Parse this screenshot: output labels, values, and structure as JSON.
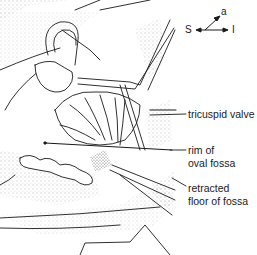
{
  "orientation": {
    "superior": "S",
    "inferior": "I",
    "anterior": "a"
  },
  "labels": {
    "tricuspid_valve": "tricuspid valve",
    "rim_line1": "rim of",
    "rim_line2": "oval fossa",
    "floor_line1": "retracted",
    "floor_line2": "floor of fossa"
  },
  "colors": {
    "ink": "#1a1a1a",
    "background": "#ffffff",
    "stipple": "#8a8a8a"
  }
}
